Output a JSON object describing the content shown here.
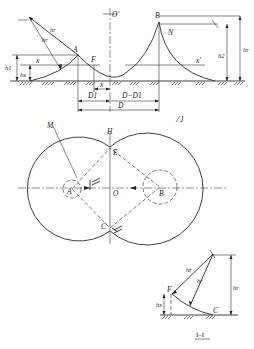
{
  "figure": {
    "top_view": {
      "labels": {
        "A": "A",
        "B": "B",
        "F": "F",
        "N": "N",
        "O_prime": "O'",
        "x": "x",
        "x_prime": "x'",
        "h1": "h1",
        "hx": "hx",
        "h2": "h2",
        "hr": "hr",
        "hr_arrow1": "hr",
        "hr_arrow2": "hx",
        "x_dim": "x",
        "D1": "D1",
        "D_minus_D1": "D−D1",
        "D": "D"
      }
    },
    "plan_view": {
      "labels": {
        "M": "M",
        "H": "H",
        "E": "E",
        "A": "A",
        "O": "O",
        "B": "B",
        "C": "C",
        "J": "J",
        "section_mark": "I"
      }
    },
    "section_view": {
      "labels": {
        "F": "F",
        "C": "C",
        "hr_1": "hr",
        "hr_2": "hr",
        "hx": "hx",
        "hr_total": "hr"
      },
      "caption": "I–I"
    }
  }
}
